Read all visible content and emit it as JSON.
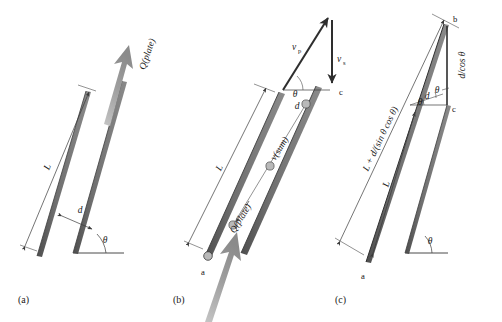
{
  "figure": {
    "background_color": "#ffffff",
    "plate_color": "#6e6e6e",
    "plate_edge_color": "#3c3c3c",
    "flux_arrow_color": "#9a9a9a",
    "line_color": "#3a3a3a",
    "text_color": "#1a1a1a",
    "bubble_fill": "#b9b9b9",
    "bubble_stroke": "#4a4a4a"
  },
  "panels": [
    {
      "id": "a",
      "caption": "(a)",
      "labels": {
        "length": "L",
        "gap": "d",
        "angle": "θ",
        "flux": "Q(plate)"
      }
    },
    {
      "id": "b",
      "caption": "(b)",
      "labels": {
        "length": "L",
        "angle": "θ",
        "gap": "d",
        "flux": "Q(plate)",
        "v_sum": "v(sum)",
        "v_p_base": "v",
        "v_p_sub": "p",
        "v_s_base": "v",
        "v_s_sub": "s",
        "point_a": "a",
        "point_c": "c"
      }
    },
    {
      "id": "c",
      "caption": "(c)",
      "labels": {
        "length": "L",
        "total_length": "L + d/(sin θ cos θ)",
        "hypotenuse": "d/cos θ",
        "angle": "θ",
        "angle_upper": "θ",
        "gap": "d",
        "point_a": "a",
        "point_b": "b",
        "point_c": "c"
      }
    }
  ]
}
